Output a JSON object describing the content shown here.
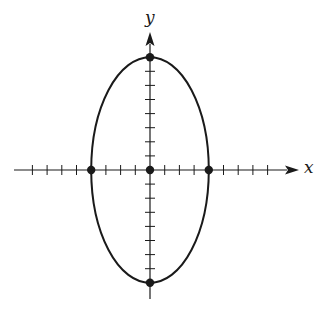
{
  "chart_data": {
    "type": "diagram",
    "title": "",
    "equation": "x^2/16 + y^2/64 = 1",
    "center": [
      0,
      0
    ],
    "semi_axis_x": 4,
    "semi_axis_y": 8,
    "xlabel": "x",
    "ylabel": "y",
    "x_ticks": [
      -8,
      -7,
      -6,
      -5,
      -4,
      -3,
      -2,
      -1,
      1,
      2,
      3,
      4,
      5,
      6,
      7,
      8
    ],
    "y_ticks": [
      -8,
      -7,
      -6,
      -5,
      -4,
      -3,
      -2,
      -1,
      1,
      2,
      3,
      4,
      5,
      6,
      7,
      8
    ],
    "xlim": [
      -9.2,
      10
    ],
    "ylim": [
      -9,
      9.5
    ],
    "marked_points": [
      {
        "x": 0,
        "y": 8,
        "name": "top-vertex"
      },
      {
        "x": 0,
        "y": -8,
        "name": "bottom-vertex"
      },
      {
        "x": -4,
        "y": 0,
        "name": "left-covertex"
      },
      {
        "x": 4,
        "y": 0,
        "name": "right-covertex"
      },
      {
        "x": 0,
        "y": 0,
        "name": "center"
      }
    ],
    "grid": false
  },
  "labels": {
    "x_axis": "x",
    "y_axis": "y"
  },
  "style": {
    "stroke": "#1a1a1a",
    "background": "#ffffff"
  }
}
